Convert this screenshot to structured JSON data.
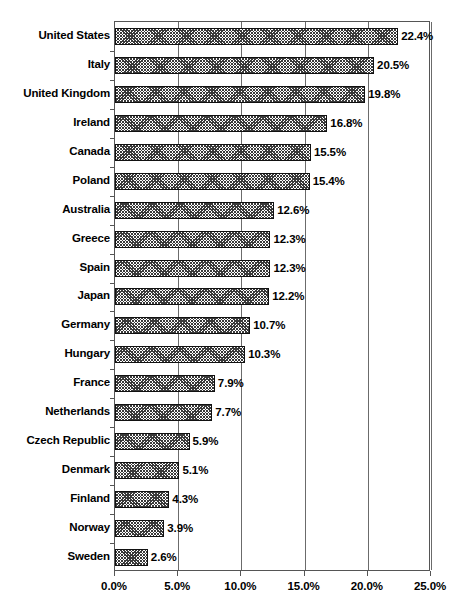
{
  "chart_data": {
    "type": "bar",
    "orientation": "horizontal",
    "title": "",
    "subtitle": "",
    "xlabel": "",
    "ylabel": "",
    "categories": [
      "United States",
      "Italy",
      "United Kingdom",
      "Ireland",
      "Canada",
      "Poland",
      "Australia",
      "Greece",
      "Spain",
      "Japan",
      "Germany",
      "Hungary",
      "France",
      "Netherlands",
      "Czech Republic",
      "Denmark",
      "Finland",
      "Norway",
      "Sweden"
    ],
    "values": [
      22.4,
      20.5,
      19.8,
      16.8,
      15.5,
      15.4,
      12.6,
      12.3,
      12.3,
      12.2,
      10.7,
      10.3,
      7.9,
      7.7,
      5.9,
      5.1,
      4.3,
      3.9,
      2.6
    ],
    "value_labels": [
      "22.4%",
      "20.5%",
      "19.8%",
      "16.8%",
      "15.5%",
      "15.4%",
      "12.6%",
      "12.3%",
      "12.3%",
      "12.2%",
      "10.7%",
      "10.3%",
      "7.9%",
      "7.7%",
      "5.9%",
      "5.1%",
      "4.3%",
      "3.9%",
      "2.6%"
    ],
    "xlim": [
      0,
      25
    ],
    "xticks": [
      0,
      5,
      10,
      15,
      20,
      25
    ],
    "xtick_labels": [
      "0.0%",
      "5.0%",
      "10.0%",
      "15.0%",
      "20.0%",
      "25.0%"
    ],
    "grid": "vertical",
    "legend": null,
    "bar_fill": "#3a3a3a",
    "bar_border": "#111111",
    "axis_color": "#555555",
    "background": "#ffffff",
    "data_label_color": "#000000"
  }
}
